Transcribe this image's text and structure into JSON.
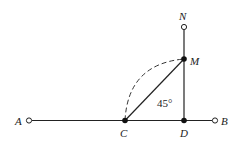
{
  "diagram": {
    "points": {
      "A": {
        "label": "A",
        "x": 29,
        "y": 120.5,
        "marker": "open"
      },
      "C": {
        "label": "C",
        "x": 125,
        "y": 120.5,
        "marker": "filled"
      },
      "D": {
        "label": "D",
        "x": 184,
        "y": 120.5,
        "marker": "filled"
      },
      "B": {
        "label": "B",
        "x": 215,
        "y": 120.5,
        "marker": "open"
      },
      "M": {
        "label": "M",
        "x": 184,
        "y": 59,
        "marker": "filled"
      },
      "N": {
        "label": "N",
        "x": 184,
        "y": 27,
        "marker": "open"
      }
    },
    "angle_label": "45°",
    "segments": [
      "A-B",
      "D-N",
      "C-M"
    ],
    "dashed_arc": "C-M"
  }
}
